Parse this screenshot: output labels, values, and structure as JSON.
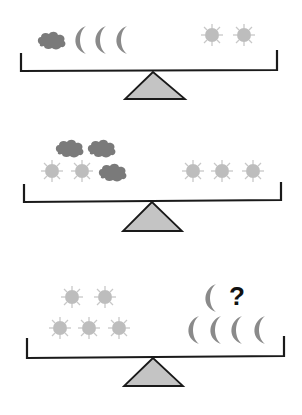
{
  "colors": {
    "background": "#ffffff",
    "beam": "#1a1a1a",
    "fulcrum_fill": "#c4c4c4",
    "fulcrum_stroke": "#1a1a1a",
    "cloud": "#7a7a7a",
    "moon": "#8a8a8a",
    "sun": "#bdbdbd",
    "question": "#111111"
  },
  "scales": [
    {
      "id": 1,
      "left": {
        "clouds": 1,
        "moons": 3,
        "suns": 0
      },
      "right": {
        "clouds": 0,
        "moons": 0,
        "suns": 2
      },
      "balanced": true
    },
    {
      "id": 2,
      "left": {
        "clouds": 3,
        "moons": 0,
        "suns": 2
      },
      "right": {
        "clouds": 0,
        "moons": 0,
        "suns": 3
      },
      "balanced": true
    },
    {
      "id": 3,
      "left": {
        "clouds": 0,
        "moons": 0,
        "suns": 5
      },
      "right": {
        "clouds": 0,
        "moons": 5,
        "suns": 0
      },
      "balanced": true,
      "question_label": "?"
    }
  ]
}
